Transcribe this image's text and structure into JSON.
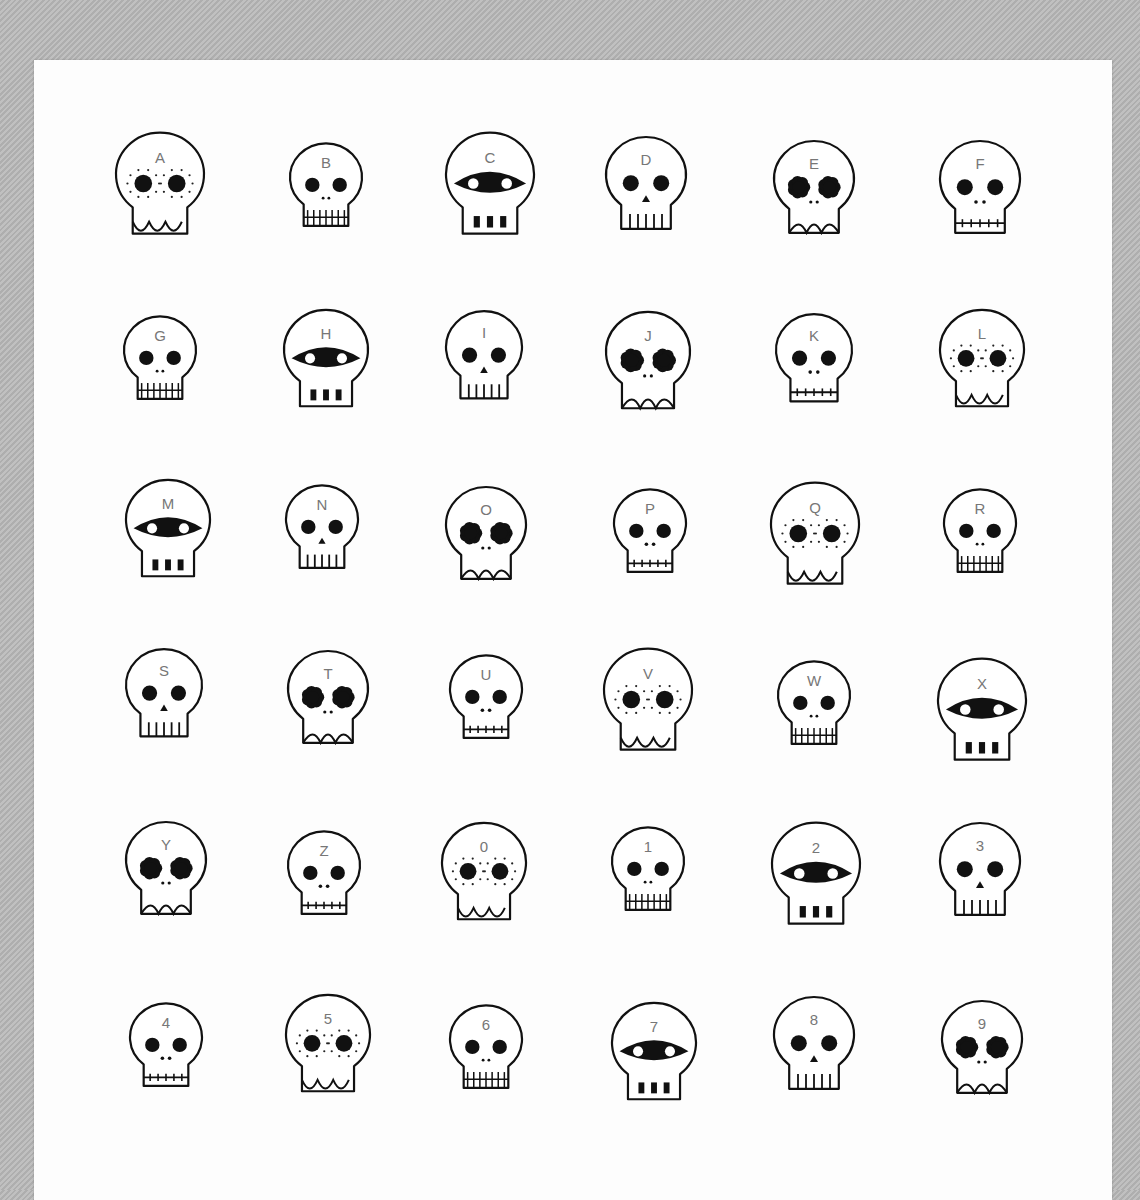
{
  "image": {
    "description": "Hand-drawn sheet of 36 cartoon skull doodles labeled A-Z and 0-9 on white paper over grey fabric",
    "colors": {
      "background": "#b9b9b9",
      "paper": "#fdfdfd",
      "ink": "#111111",
      "label": "#777777"
    }
  },
  "skulls": [
    {
      "label": "A",
      "style": "freckles",
      "cx": 160,
      "cy": 180,
      "r": 44
    },
    {
      "label": "B",
      "style": "plain-grid-teeth",
      "cx": 326,
      "cy": 182,
      "r": 36
    },
    {
      "label": "C",
      "style": "mask-block-teeth",
      "cx": 490,
      "cy": 180,
      "r": 44
    },
    {
      "label": "D",
      "style": "plain-triangle-nose",
      "cx": 646,
      "cy": 180,
      "r": 40
    },
    {
      "label": "E",
      "style": "flower-eyes",
      "cx": 814,
      "cy": 184,
      "r": 40
    },
    {
      "label": "F",
      "style": "plain-stitch",
      "cx": 980,
      "cy": 184,
      "r": 40
    },
    {
      "label": "G",
      "style": "plain-grid-teeth",
      "cx": 160,
      "cy": 355,
      "r": 36
    },
    {
      "label": "H",
      "style": "mask-block-teeth",
      "cx": 326,
      "cy": 355,
      "r": 42
    },
    {
      "label": "I",
      "style": "plain-triangle-nose",
      "cx": 484,
      "cy": 352,
      "r": 38
    },
    {
      "label": "J",
      "style": "flower-eyes",
      "cx": 648,
      "cy": 357,
      "r": 42
    },
    {
      "label": "K",
      "style": "plain-stitch",
      "cx": 814,
      "cy": 355,
      "r": 38
    },
    {
      "label": "L",
      "style": "freckles",
      "cx": 982,
      "cy": 355,
      "r": 42
    },
    {
      "label": "M",
      "style": "mask-block-teeth",
      "cx": 168,
      "cy": 525,
      "r": 42
    },
    {
      "label": "N",
      "style": "plain-triangle-nose",
      "cx": 322,
      "cy": 524,
      "r": 36
    },
    {
      "label": "O",
      "style": "flower-eyes",
      "cx": 486,
      "cy": 530,
      "r": 40
    },
    {
      "label": "P",
      "style": "plain-stitch",
      "cx": 650,
      "cy": 528,
      "r": 36
    },
    {
      "label": "Q",
      "style": "freckles",
      "cx": 815,
      "cy": 530,
      "r": 44
    },
    {
      "label": "R",
      "style": "plain-grid-teeth",
      "cx": 980,
      "cy": 528,
      "r": 36
    },
    {
      "label": "S",
      "style": "plain-triangle-nose",
      "cx": 164,
      "cy": 690,
      "r": 38
    },
    {
      "label": "T",
      "style": "flower-eyes",
      "cx": 328,
      "cy": 694,
      "r": 40
    },
    {
      "label": "U",
      "style": "plain-stitch",
      "cx": 486,
      "cy": 694,
      "r": 36
    },
    {
      "label": "V",
      "style": "freckles",
      "cx": 648,
      "cy": 696,
      "r": 44
    },
    {
      "label": "W",
      "style": "plain-grid-teeth",
      "cx": 814,
      "cy": 700,
      "r": 36
    },
    {
      "label": "X",
      "style": "mask-block-teeth",
      "cx": 982,
      "cy": 706,
      "r": 44
    },
    {
      "label": "Y",
      "style": "flower-eyes",
      "cx": 166,
      "cy": 865,
      "r": 40
    },
    {
      "label": "Z",
      "style": "plain-stitch",
      "cx": 324,
      "cy": 870,
      "r": 36
    },
    {
      "label": "0",
      "style": "freckles",
      "cx": 484,
      "cy": 868,
      "r": 42
    },
    {
      "label": "1",
      "style": "plain-grid-teeth",
      "cx": 648,
      "cy": 866,
      "r": 36
    },
    {
      "label": "2",
      "style": "mask-block-teeth",
      "cx": 816,
      "cy": 870,
      "r": 44
    },
    {
      "label": "3",
      "style": "plain-triangle-nose",
      "cx": 980,
      "cy": 866,
      "r": 40
    },
    {
      "label": "4",
      "style": "plain-stitch",
      "cx": 166,
      "cy": 1042,
      "r": 36
    },
    {
      "label": "5",
      "style": "freckles",
      "cx": 328,
      "cy": 1040,
      "r": 42
    },
    {
      "label": "6",
      "style": "plain-grid-teeth",
      "cx": 486,
      "cy": 1044,
      "r": 36
    },
    {
      "label": "7",
      "style": "mask-block-teeth",
      "cx": 654,
      "cy": 1048,
      "r": 42
    },
    {
      "label": "8",
      "style": "plain-triangle-nose",
      "cx": 814,
      "cy": 1040,
      "r": 40
    },
    {
      "label": "9",
      "style": "flower-eyes",
      "cx": 982,
      "cy": 1044,
      "r": 40
    }
  ]
}
